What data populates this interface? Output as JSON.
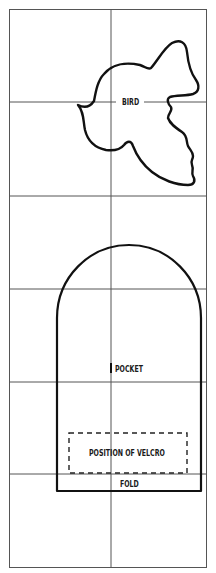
{
  "pattern": {
    "grid": {
      "columns": 2,
      "rows": 6,
      "line_color": "#555555",
      "outline_color": "#1a1a1a"
    },
    "pieces": [
      {
        "id": "bird",
        "label": "BIRD",
        "type": "solid-outline"
      },
      {
        "id": "pocket",
        "label": "POCKET",
        "type": "solid-outline"
      },
      {
        "id": "velcro",
        "label": "POSITION OF VELCRO",
        "type": "dashed-outline"
      },
      {
        "id": "fold",
        "label": "FOLD",
        "type": "fold-line"
      }
    ]
  },
  "labels": {
    "bird": "BIRD",
    "pocket": "POCKET",
    "velcro": "POSITION OF VELCRO",
    "fold": "FOLD"
  }
}
